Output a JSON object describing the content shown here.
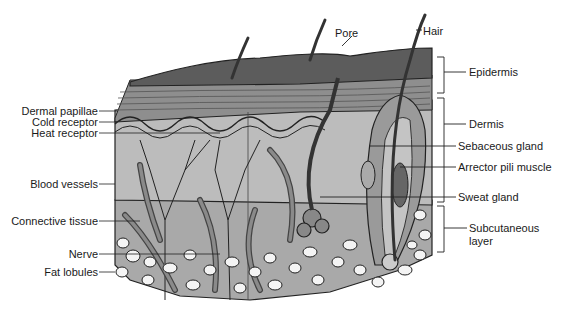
{
  "labels": {
    "top": {
      "pore": "Pore",
      "hair": "Hair"
    },
    "left": {
      "dermal_papillae": "Dermal papillae",
      "cold_receptor": "Cold receptor",
      "heat_receptor": "Heat receptor",
      "blood_vessels": "Blood vessels",
      "connective_tissue": "Connective tissue",
      "nerve": "Nerve",
      "fat_lobules": "Fat lobules"
    },
    "right": {
      "epidermis": "Epidermis",
      "dermis": "Dermis",
      "sebaceous_gland": "Sebaceous gland",
      "arrector_pili_muscle": "Arrector pili muscle",
      "sweat_gland": "Sweat gland",
      "subcutaneous_layer_line1": "Subcutaneous",
      "subcutaneous_layer_line2": "layer"
    }
  },
  "colors": {
    "epidermis_top": "#5a5a5a",
    "epidermis_layers": "#8c8c8c",
    "dermis": "#b8b8b8",
    "subcutaneous": "#a8a8a8",
    "fat": "#f4f4f4",
    "vessel": "#6e6e6e",
    "line": "#222222"
  }
}
